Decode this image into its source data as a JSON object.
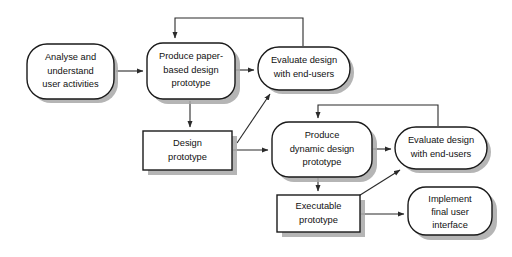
{
  "diagram": {
    "background_color": "#ffffff",
    "stroke_color": "#1a1a1a",
    "shadow_color": "#a8a8a8",
    "fill_color": "#ffffff",
    "nodes": [
      {
        "id": "analyse",
        "shape": "rounded",
        "lines": [
          "Analyse and",
          "understand",
          "user activities"
        ]
      },
      {
        "id": "produce-paper-prototype",
        "shape": "rounded",
        "lines": [
          "Produce paper-",
          "based design",
          "prototype"
        ]
      },
      {
        "id": "evaluate-design-1",
        "shape": "rounded",
        "lines": [
          "Evaluate design",
          "with end-users"
        ]
      },
      {
        "id": "design-prototype",
        "shape": "rectangle",
        "lines": [
          "Design",
          "prototype"
        ]
      },
      {
        "id": "produce-dynamic-prototype",
        "shape": "rounded",
        "lines": [
          "Produce",
          "dynamic design",
          "prototype"
        ]
      },
      {
        "id": "evaluate-design-2",
        "shape": "rounded",
        "lines": [
          "Evaluate design",
          "with end-users"
        ]
      },
      {
        "id": "executable-prototype",
        "shape": "rectangle",
        "lines": [
          "Executable",
          "prototype"
        ]
      },
      {
        "id": "implement-final-ui",
        "shape": "rounded",
        "lines": [
          "Implement",
          "final user",
          "interface"
        ]
      }
    ],
    "edges": [
      {
        "id": "analyse-to-paper",
        "from": "analyse",
        "to": "produce-paper-prototype",
        "style": "straight-arrow"
      },
      {
        "id": "paper-to-evaluate1",
        "from": "produce-paper-prototype",
        "to": "evaluate-design-1",
        "style": "straight-arrow"
      },
      {
        "id": "evaluate1-feedback-to-paper",
        "from": "evaluate-design-1",
        "to": "produce-paper-prototype",
        "style": "feedback-loop-arrow"
      },
      {
        "id": "paper-to-design-prototype",
        "from": "produce-paper-prototype",
        "to": "design-prototype",
        "style": "straight-arrow"
      },
      {
        "id": "design-prototype-to-evaluate1",
        "from": "design-prototype",
        "to": "evaluate-design-1",
        "style": "diagonal-arrow"
      },
      {
        "id": "design-prototype-to-dynamic",
        "from": "design-prototype",
        "to": "produce-dynamic-prototype",
        "style": "straight-arrow"
      },
      {
        "id": "dynamic-to-evaluate2",
        "from": "produce-dynamic-prototype",
        "to": "evaluate-design-2",
        "style": "straight-arrow"
      },
      {
        "id": "evaluate2-feedback-to-dynamic",
        "from": "evaluate-design-2",
        "to": "produce-dynamic-prototype",
        "style": "feedback-loop-arrow"
      },
      {
        "id": "dynamic-to-executable",
        "from": "produce-dynamic-prototype",
        "to": "executable-prototype",
        "style": "straight-arrow"
      },
      {
        "id": "executable-to-evaluate2",
        "from": "executable-prototype",
        "to": "evaluate-design-2",
        "style": "diagonal-arrow"
      },
      {
        "id": "executable-to-implement",
        "from": "executable-prototype",
        "to": "implement-final-ui",
        "style": "straight-arrow"
      }
    ]
  }
}
